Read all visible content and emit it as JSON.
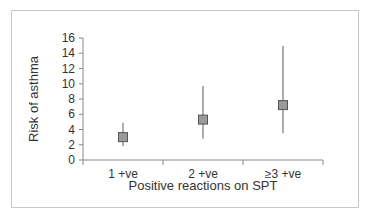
{
  "chart_data": {
    "type": "scatter",
    "title": "",
    "xlabel": "Positive reactions on SPT",
    "ylabel": "Risk of asthma",
    "categories": [
      "1 +ve",
      "2 +ve",
      "≥3 +ve"
    ],
    "values": [
      3.0,
      5.3,
      7.2
    ],
    "error_low": [
      1.8,
      2.8,
      3.5
    ],
    "error_high": [
      4.9,
      9.7,
      15.0
    ],
    "ylim": [
      0,
      16
    ],
    "yticks": [
      0,
      2,
      4,
      6,
      8,
      10,
      12,
      14,
      16
    ],
    "grid": false,
    "legend": null,
    "marker": "square",
    "marker_color": "#9a9a9a",
    "line_color": "#777777"
  }
}
